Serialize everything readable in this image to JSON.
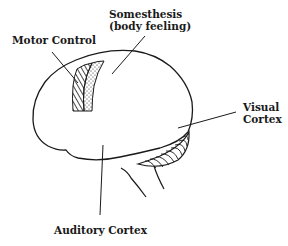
{
  "diagram": {
    "labels": {
      "motor": "Motor Control",
      "somesthesis_line1": "Somesthesis",
      "somesthesis_line2": "(body feeling)",
      "visual_line1": "Visual",
      "visual_line2": "Cortex",
      "auditory": "Auditory Cortex"
    },
    "colors": {
      "ink": "#1a1a1a",
      "background": "#ffffff"
    }
  }
}
